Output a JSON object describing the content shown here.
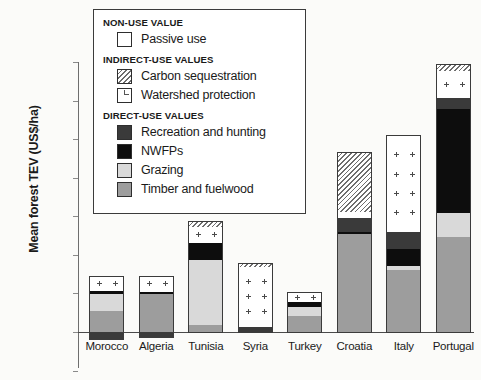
{
  "chart_data": {
    "type": "bar",
    "subtype": "stacked",
    "title": "",
    "xlabel": "",
    "ylabel": "Mean forest TEV (US$/ha)",
    "ylim": [
      -50,
      350
    ],
    "yticks": [
      -50,
      0,
      50,
      100,
      150,
      200,
      250,
      300,
      350
    ],
    "grid": false,
    "legend_position": "top-left-inset",
    "categories": [
      "Morocco",
      "Algeria",
      "Tunisia",
      "Syria",
      "Turkey",
      "Croatia",
      "Italy",
      "Portugal"
    ],
    "series": [
      {
        "name": "Timber and fuelwood",
        "key": "timber",
        "color": "#9d9d9d",
        "values": [
          28,
          50,
          10,
          0,
          22,
          128,
          82,
          125
        ]
      },
      {
        "name": "Grazing",
        "key": "grazing",
        "color": "#d9d9d9",
        "values": [
          22,
          0,
          85,
          0,
          12,
          0,
          5,
          30
        ]
      },
      {
        "name": "NWFPs",
        "key": "nwfp",
        "color": "#0d0d0d",
        "values": [
          4,
          3,
          22,
          0,
          6,
          3,
          22,
          135
        ]
      },
      {
        "name": "Recreation and hunting",
        "key": "recreation",
        "color": "#3a3a3a",
        "values": [
          0,
          0,
          0,
          8,
          0,
          18,
          22,
          15
        ]
      },
      {
        "name": "Watershed protection",
        "key": "watershed",
        "color": "#ffffff",
        "values": [
          18,
          20,
          20,
          78,
          12,
          8,
          124,
          34
        ]
      },
      {
        "name": "Carbon sequestration",
        "key": "carbon",
        "color": "hatched",
        "values": [
          0,
          0,
          7,
          3,
          0,
          76,
          0,
          9
        ]
      },
      {
        "name": "Negative value",
        "key": "negative",
        "color": "#3a3a3a",
        "values": [
          -10,
          -8,
          0,
          0,
          0,
          0,
          0,
          0
        ]
      }
    ],
    "totals": [
      72,
      73,
      144,
      89,
      52,
      233,
      255,
      348
    ]
  },
  "axis": {
    "y_title": "Mean forest TEV (US$/ha)",
    "y_ticks": [
      "350",
      "300",
      "250",
      "200",
      "150",
      "100",
      "50",
      "0",
      "-50"
    ],
    "x_ticks": [
      "Morocco",
      "Algeria",
      "Tunisia",
      "Syria",
      "Turkey",
      "Croatia",
      "Italy",
      "Portugal"
    ]
  },
  "legend": {
    "groups": [
      {
        "heading": "NON-USE VALUE",
        "items": [
          {
            "label": "Passive use",
            "swatch": "passive"
          }
        ]
      },
      {
        "heading": "INDIRECT-USE VALUES",
        "items": [
          {
            "label": "Carbon sequestration",
            "swatch": "carbon"
          },
          {
            "label": "Watershed protection",
            "swatch": "watershed"
          }
        ]
      },
      {
        "heading": "DIRECT-USE VALUES",
        "items": [
          {
            "label": "Recreation and hunting",
            "swatch": "recreation"
          },
          {
            "label": "NWFPs",
            "swatch": "nwfp"
          },
          {
            "label": "Grazing",
            "swatch": "grazing"
          },
          {
            "label": "Timber and fuelwood",
            "swatch": "timber"
          }
        ]
      }
    ]
  }
}
